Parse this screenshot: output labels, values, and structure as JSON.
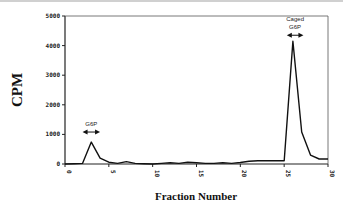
{
  "chart_data": {
    "type": "line",
    "title": "",
    "xlabel": "Fraction Number",
    "ylabel": "CPM",
    "xlim": [
      0,
      30
    ],
    "ylim": [
      0,
      5000
    ],
    "x_ticks": [
      0,
      5,
      10,
      15,
      20,
      25,
      30
    ],
    "x_tick_labels": [
      "0",
      "5",
      "10",
      "15",
      "20",
      "25",
      "30"
    ],
    "y_ticks": [
      0,
      1000,
      2000,
      3000,
      4000,
      5000
    ],
    "y_tick_labels": [
      "0",
      "1000",
      "2000",
      "3000",
      "4000",
      "5000"
    ],
    "grid": false,
    "series": [
      {
        "name": "CPM",
        "x": [
          0,
          1,
          2,
          3,
          4,
          5,
          6,
          7,
          8,
          9,
          10,
          11,
          12,
          13,
          14,
          15,
          16,
          17,
          18,
          19,
          20,
          21,
          22,
          23,
          24,
          25,
          26,
          27,
          28,
          29,
          30
        ],
        "values": [
          0,
          10,
          20,
          740,
          200,
          60,
          20,
          80,
          20,
          10,
          0,
          20,
          40,
          20,
          60,
          40,
          20,
          20,
          40,
          20,
          50,
          90,
          110,
          110,
          110,
          110,
          4150,
          1080,
          300,
          170,
          170
        ]
      }
    ],
    "annotations": [
      {
        "label": "G6P",
        "x_range": [
          2,
          4
        ],
        "y": 1080
      },
      {
        "label_lines": [
          "Caged",
          "G6P"
        ],
        "x_range": [
          25.3,
          27.2
        ],
        "y": 4350
      }
    ]
  }
}
